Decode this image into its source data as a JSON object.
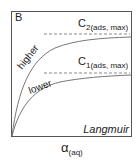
{
  "panel": {
    "label": "B",
    "model_name": "Langmuir",
    "x_axis_label_main": "α",
    "x_axis_label_sub": "(aq)"
  },
  "curves": [
    {
      "name": "higher",
      "label": "higher",
      "asymptote_main": "C",
      "asymptote_sub": "2(ads, max)"
    },
    {
      "name": "lower",
      "label": "lower",
      "asymptote_main": "C",
      "asymptote_sub": "1(ads, max)"
    }
  ],
  "colors": {
    "frame": "#555555",
    "curve": "#777777",
    "dashed": "#888888",
    "text": "#222222"
  }
}
